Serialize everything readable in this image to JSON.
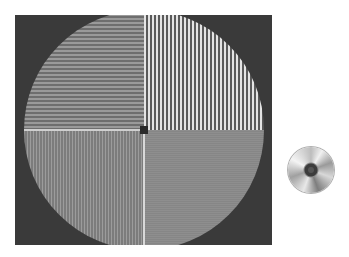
{
  "figure": {
    "panel_background": "#3a3a3a",
    "test_pattern": {
      "shape": "circle-quadrant-gratings",
      "quadrants": [
        {
          "position": "top-left",
          "orientation": "horizontal",
          "period_px": 4,
          "contrast": "medium"
        },
        {
          "position": "top-right",
          "orientation": "vertical",
          "period_px": 4,
          "contrast": "high"
        },
        {
          "position": "bottom-left",
          "orientation": "vertical",
          "period_px": 3,
          "contrast": "low"
        },
        {
          "position": "bottom-right",
          "orientation": "horizontal",
          "period_px": 2,
          "contrast": "very-low"
        }
      ]
    },
    "icons": [
      {
        "name": "cd-disc-icon"
      }
    ]
  }
}
